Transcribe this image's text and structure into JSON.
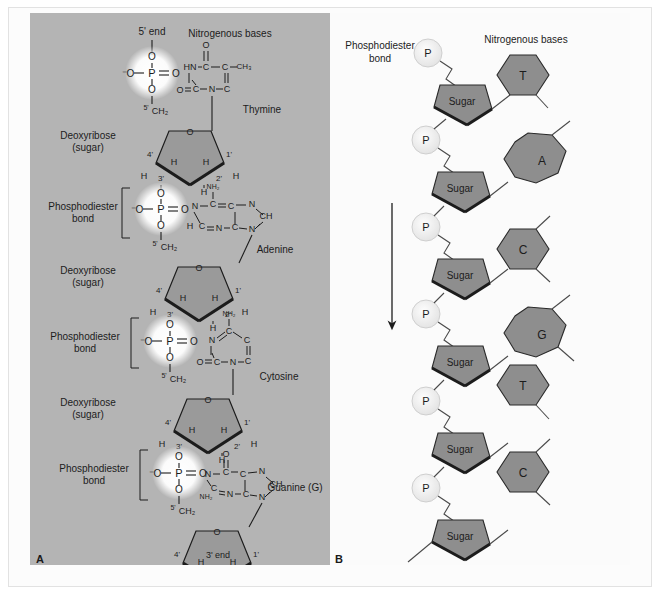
{
  "figure": {
    "panels": [
      {
        "tag": "A",
        "label": "A"
      },
      {
        "tag": "B",
        "label": "B"
      }
    ]
  },
  "panelA": {
    "top_label": "5' end",
    "bottom_label": "3' end",
    "bases_header": "Nitrogenous bases",
    "sugar_label_line1": "Deoxyribose",
    "sugar_label_line2": "(sugar)",
    "bond_label_line1": "Phosphodiester",
    "bond_label_line2": "bond",
    "nucleotides": [
      {
        "base_name": "Thymine",
        "base_type": "pyrimidine"
      },
      {
        "base_name": "Adenine",
        "base_type": "purine"
      },
      {
        "base_name": "Cytosine",
        "base_type": "pyrimidine"
      },
      {
        "base_name": "Guanine (G)",
        "base_type": "purine"
      }
    ],
    "atoms": {
      "phosphorus": "P",
      "oxygen": "O",
      "oxygen_minus": "⁻O",
      "nitrogen": "N",
      "carbon": "C",
      "hydrogen": "H",
      "hn": "HN",
      "ch": "CH",
      "ch2": "CH₂",
      "ch3": "CH₃",
      "nh2": "NH₂"
    },
    "ring_positions": {
      "c1": "1'",
      "c2": "2'",
      "c3": "3'",
      "c4": "4'",
      "c5": "5'"
    }
  },
  "panelB": {
    "bond_label_line1": "Phosphodiester",
    "bond_label_line2": "bond",
    "bases_header": "Nitrogenous bases",
    "phosphate_label": "P",
    "sugar_label": "Sugar",
    "direction_arrow": "down",
    "units": [
      {
        "phosphate": "P",
        "sugar": "Sugar",
        "base": "T",
        "base_type": "pyrimidine"
      },
      {
        "phosphate": "P",
        "sugar": "Sugar",
        "base": "A",
        "base_type": "purine"
      },
      {
        "phosphate": "P",
        "sugar": "Sugar",
        "base": "C",
        "base_type": "pyrimidine"
      },
      {
        "phosphate": "P",
        "sugar": "Sugar",
        "base": "G",
        "base_type": "purine"
      },
      {
        "phosphate": "P",
        "sugar": "Sugar",
        "base": "T",
        "base_type": "pyrimidine"
      },
      {
        "phosphate": "P",
        "sugar": "Sugar",
        "base": "C",
        "base_type": "pyrimidine"
      }
    ]
  },
  "colors": {
    "panelA_bg": "#b4b4b4",
    "panelB_bg": "#fbfbfb",
    "sugar_fill": "#9a9a9a",
    "base_fill": "#8c8c8c",
    "phosphate_fill": "#ededed",
    "stroke": "#1c1c1c",
    "page_bg": "#ffffff"
  }
}
